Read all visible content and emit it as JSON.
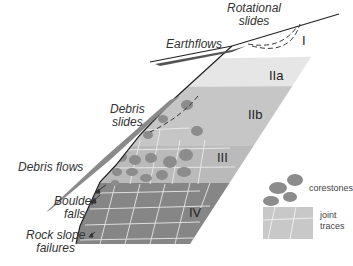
{
  "diagram": {
    "type": "weathering-profile-cross-section",
    "zones": [
      {
        "id": "I",
        "label": "I",
        "color": "#ffffff"
      },
      {
        "id": "IIa",
        "label": "IIa",
        "color": "#e8e8e8"
      },
      {
        "id": "IIb",
        "label": "IIb",
        "color": "#c8c8c8"
      },
      {
        "id": "III",
        "label": "III",
        "color": "#bdbdbd"
      },
      {
        "id": "IV",
        "label": "IV",
        "color": "#8a8a8a"
      }
    ],
    "processes": [
      {
        "id": "rotational",
        "label_line1": "Rotational",
        "label_line2": "slides"
      },
      {
        "id": "earthflows",
        "label_line1": "Earthflows"
      },
      {
        "id": "debris_slides",
        "label_line1": "Debris",
        "label_line2": "slides"
      },
      {
        "id": "debris_flows",
        "label_line1": "Debris flows"
      },
      {
        "id": "boulder_falls",
        "label_line1": "Boulder",
        "label_line2": "falls"
      },
      {
        "id": "rock_slope",
        "label_line1": "Rock slope",
        "label_line2": "failures"
      }
    ],
    "legend": {
      "corestones": "corestones",
      "joint_line1": "joint",
      "joint_line2": "traces"
    }
  }
}
